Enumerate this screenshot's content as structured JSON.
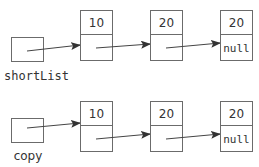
{
  "diagram": {
    "lists": [
      {
        "variable": "shortList",
        "nodes": [
          {
            "value": "10",
            "next": ""
          },
          {
            "value": "20",
            "next": ""
          },
          {
            "value": "20",
            "next": "null"
          }
        ]
      },
      {
        "variable": "copy",
        "nodes": [
          {
            "value": "10",
            "next": ""
          },
          {
            "value": "20",
            "next": ""
          },
          {
            "value": "20",
            "next": "null"
          }
        ]
      }
    ],
    "colors": {
      "box_stroke": "#6b6b6b",
      "arrow": "#444444",
      "text": "#333333",
      "background": "#ffffff"
    }
  }
}
